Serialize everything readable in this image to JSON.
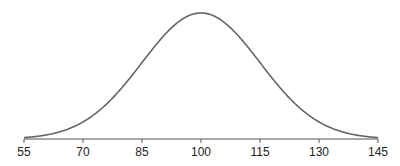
{
  "chart_data": {
    "type": "line",
    "title": "",
    "xlabel": "",
    "ylabel": "",
    "mean": 100,
    "sd": 15,
    "xlim": [
      55,
      145
    ],
    "x_ticks": [
      55,
      70,
      85,
      100,
      115,
      130,
      145
    ],
    "x_tick_labels": [
      "55",
      "70",
      "85",
      "100",
      "115",
      "130",
      "145"
    ],
    "grid": false,
    "y_axis_visible": false,
    "line_color": "#666666"
  }
}
